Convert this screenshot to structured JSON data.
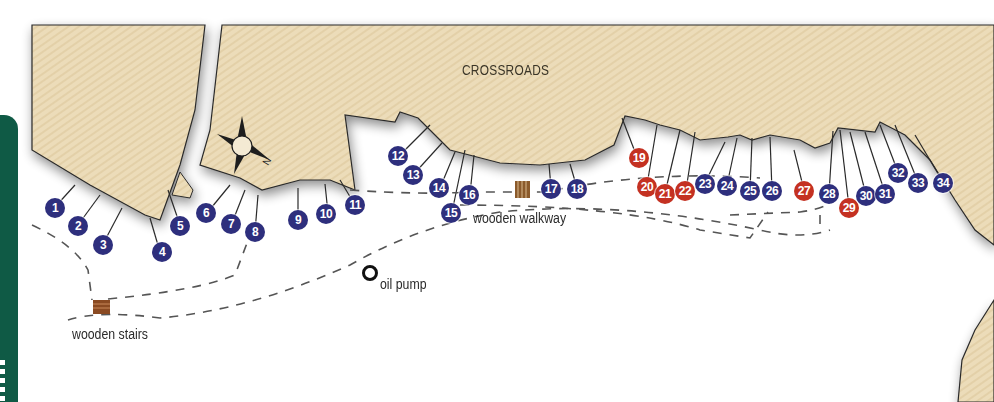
{
  "map": {
    "area_label": "CROSSROADS",
    "landmarks": [
      {
        "name": "wooden stairs",
        "icon": "stairs-icon"
      },
      {
        "name": "wooden walkway",
        "icon": "walkway-icon"
      },
      {
        "name": "oil pump",
        "icon": "oil-pump-icon"
      }
    ],
    "compass": {
      "icon": "compass-rose-icon",
      "direction_label": "N"
    },
    "colors": {
      "blue_marker": "#2e2f7d",
      "red_marker": "#c43122",
      "building": "#eadbb8",
      "path": "#555555",
      "side_tab": "#0f5a45"
    },
    "markers": [
      {
        "n": "1",
        "color": "blue"
      },
      {
        "n": "2",
        "color": "blue"
      },
      {
        "n": "3",
        "color": "blue"
      },
      {
        "n": "4",
        "color": "blue"
      },
      {
        "n": "5",
        "color": "blue"
      },
      {
        "n": "6",
        "color": "blue"
      },
      {
        "n": "7",
        "color": "blue"
      },
      {
        "n": "8",
        "color": "blue"
      },
      {
        "n": "9",
        "color": "blue"
      },
      {
        "n": "10",
        "color": "blue"
      },
      {
        "n": "11",
        "color": "blue"
      },
      {
        "n": "12",
        "color": "blue"
      },
      {
        "n": "13",
        "color": "blue"
      },
      {
        "n": "14",
        "color": "blue"
      },
      {
        "n": "15",
        "color": "blue"
      },
      {
        "n": "16",
        "color": "blue"
      },
      {
        "n": "17",
        "color": "blue"
      },
      {
        "n": "18",
        "color": "blue"
      },
      {
        "n": "19",
        "color": "red"
      },
      {
        "n": "20",
        "color": "red"
      },
      {
        "n": "21",
        "color": "red"
      },
      {
        "n": "22",
        "color": "red"
      },
      {
        "n": "23",
        "color": "blue"
      },
      {
        "n": "24",
        "color": "blue"
      },
      {
        "n": "25",
        "color": "blue"
      },
      {
        "n": "26",
        "color": "blue"
      },
      {
        "n": "27",
        "color": "red"
      },
      {
        "n": "28",
        "color": "blue"
      },
      {
        "n": "29",
        "color": "red"
      },
      {
        "n": "30",
        "color": "blue"
      },
      {
        "n": "31",
        "color": "blue"
      },
      {
        "n": "32",
        "color": "blue"
      },
      {
        "n": "33",
        "color": "blue"
      },
      {
        "n": "34",
        "color": "blue"
      }
    ]
  }
}
